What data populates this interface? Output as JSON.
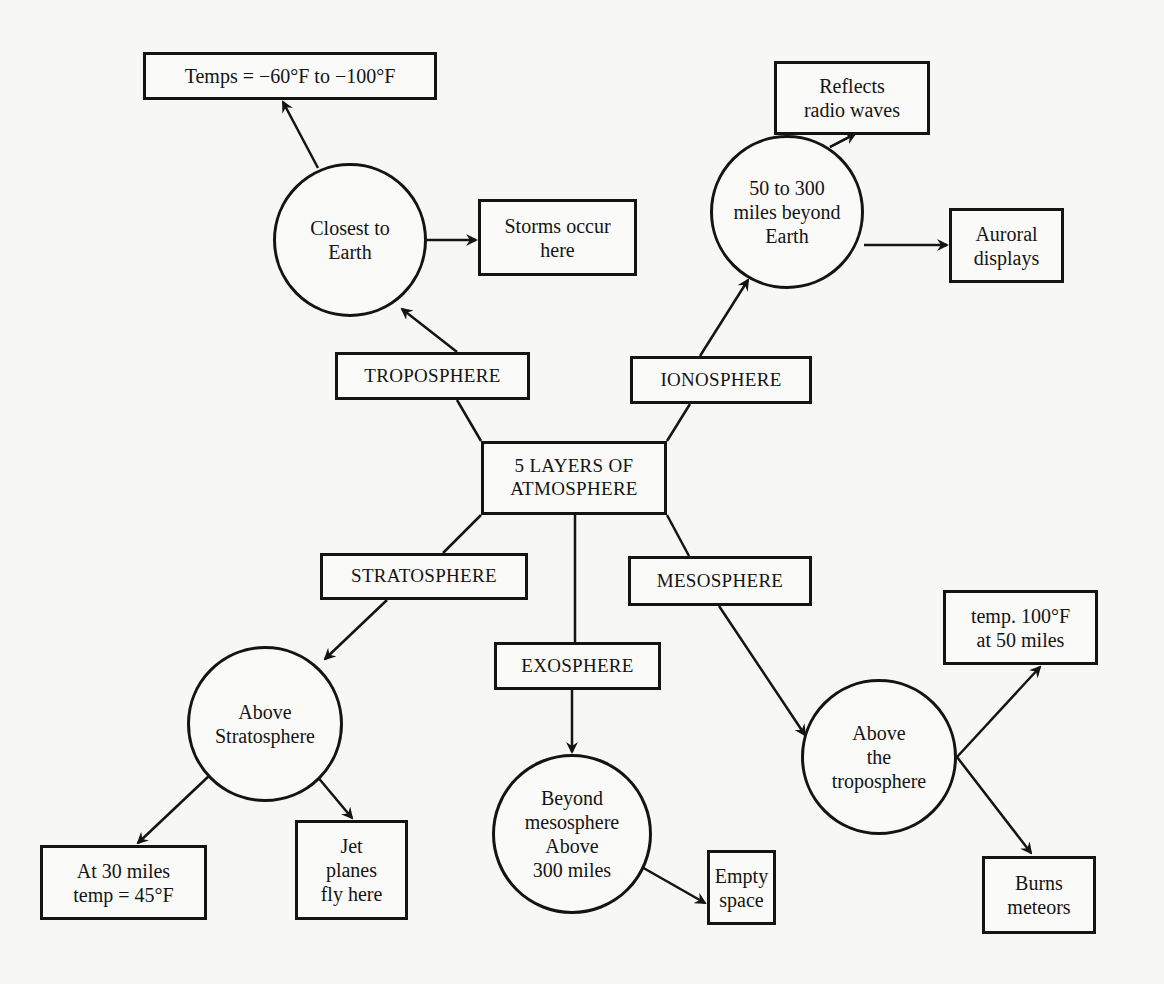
{
  "diagram": {
    "center": {
      "label": "5 LAYERS OF\nATMOSPHERE"
    },
    "layers": [
      {
        "name": "TROPOSPHERE",
        "circle": "Closest to\nEarth",
        "facts": [
          "Temps = −60°F to −100°F",
          "Storms occur\nhere"
        ]
      },
      {
        "name": "IONOSPHERE",
        "circle": "50 to 300\nmiles beyond\nEarth",
        "facts": [
          "Reflects\nradio waves",
          "Auroral\ndisplays"
        ]
      },
      {
        "name": "STRATOSPHERE",
        "circle": "Above\nStratosphere",
        "facts": [
          "At 30 miles\ntemp = 45°F",
          "Jet\nplanes\nfly here"
        ]
      },
      {
        "name": "EXOSPHERE",
        "circle": "Beyond\nmesosphere\nAbove\n300 miles",
        "facts": [
          "Empty\nspace"
        ]
      },
      {
        "name": "MESOSPHERE",
        "circle": "Above\nthe\ntroposphere",
        "facts": [
          "temp. 100°F\nat 50 miles",
          "Burns\nmeteors"
        ]
      }
    ]
  },
  "colors": {
    "ink": "#141414",
    "paper": "#f7f7f5"
  }
}
